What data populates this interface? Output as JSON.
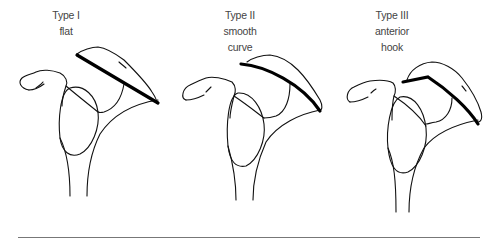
{
  "figure": {
    "panels": [
      {
        "type_label": "Type I",
        "shape_label": "flat",
        "shape_label_2": ""
      },
      {
        "type_label": "Type II",
        "shape_label": "smooth",
        "shape_label_2": "curve"
      },
      {
        "type_label": "Type III",
        "shape_label": "anterior",
        "shape_label_2": "hook"
      }
    ],
    "colors": {
      "line": "#000000",
      "outline": "#111111",
      "text": "#444444",
      "rule": "#777777"
    }
  }
}
